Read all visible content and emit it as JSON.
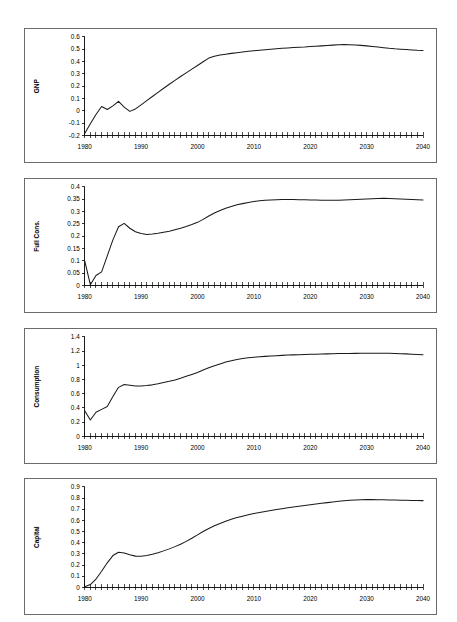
{
  "page": {
    "background": "#ffffff",
    "line_color": "#1a1a1a",
    "border_color": "#6b6b6b",
    "panel_count": 4
  },
  "chart_data": [
    {
      "type": "line",
      "title": "",
      "xlabel": "",
      "ylabel": "GNP",
      "xlim": [
        1980,
        2040
      ],
      "ylim": [
        -0.2,
        0.6
      ],
      "ytick_step": 0.1,
      "yticks": [
        -0.2,
        -0.1,
        0,
        0.1,
        0.2,
        0.3,
        0.4,
        0.5,
        0.6
      ],
      "ytick_labels": [
        "-0.2",
        "-0.1",
        "0",
        "0.1",
        "0.2",
        "0.3",
        "0.4",
        "0.5",
        "0.6"
      ],
      "xticks": [
        1980,
        1990,
        2000,
        2010,
        2020,
        2030,
        2040
      ],
      "xtick_labels": [
        "1980",
        "1990",
        "2000",
        "2010",
        "2020",
        "2030",
        "2040"
      ],
      "xtick_minor_step": 1,
      "grid": false,
      "legend": "none",
      "x": [
        1980,
        1981,
        1982,
        1983,
        1984,
        1985,
        1986,
        1987,
        1988,
        1989,
        1990,
        1991,
        1992,
        1993,
        1994,
        1995,
        1996,
        1997,
        1998,
        1999,
        2000,
        2001,
        2002,
        2003,
        2004,
        2005,
        2006,
        2007,
        2008,
        2009,
        2010,
        2011,
        2012,
        2013,
        2014,
        2015,
        2016,
        2017,
        2018,
        2019,
        2020,
        2021,
        2022,
        2023,
        2024,
        2025,
        2026,
        2027,
        2028,
        2029,
        2030,
        2031,
        2032,
        2033,
        2034,
        2035,
        2036,
        2037,
        2038,
        2039,
        2040
      ],
      "values": [
        -0.185,
        -0.105,
        -0.03,
        0.035,
        0.01,
        0.04,
        0.076,
        0.03,
        -0.005,
        0.015,
        0.048,
        0.082,
        0.116,
        0.15,
        0.183,
        0.215,
        0.247,
        0.278,
        0.308,
        0.338,
        0.368,
        0.398,
        0.428,
        0.443,
        0.452,
        0.459,
        0.466,
        0.472,
        0.478,
        0.483,
        0.488,
        0.492,
        0.496,
        0.5,
        0.504,
        0.507,
        0.51,
        0.513,
        0.516,
        0.518,
        0.521,
        0.524,
        0.527,
        0.53,
        0.533,
        0.536,
        0.537,
        0.536,
        0.534,
        0.531,
        0.527,
        0.522,
        0.517,
        0.512,
        0.507,
        0.503,
        0.5,
        0.497,
        0.494,
        0.491,
        0.489
      ]
    },
    {
      "type": "line",
      "title": "",
      "xlabel": "",
      "ylabel": "Full Cons.",
      "xlim": [
        1980,
        2040
      ],
      "ylim": [
        0,
        0.4
      ],
      "ytick_step": 0.05,
      "yticks": [
        0,
        0.05,
        0.1,
        0.15,
        0.2,
        0.25,
        0.3,
        0.35,
        0.4
      ],
      "ytick_labels": [
        "0",
        "0.05",
        "0.1",
        "0.15",
        "0.2",
        "0.25",
        "0.3",
        "0.35",
        "0.4"
      ],
      "xticks": [
        1980,
        1990,
        2000,
        2010,
        2020,
        2030,
        2040
      ],
      "xtick_labels": [
        "1980",
        "1990",
        "2000",
        "2010",
        "2020",
        "2030",
        "2040"
      ],
      "xtick_minor_step": 1,
      "grid": false,
      "legend": "none",
      "x": [
        1980,
        1981,
        1982,
        1983,
        1984,
        1985,
        1986,
        1987,
        1988,
        1989,
        1990,
        1991,
        1992,
        1993,
        1994,
        1995,
        1996,
        1997,
        1998,
        1999,
        2000,
        2001,
        2002,
        2003,
        2004,
        2005,
        2006,
        2007,
        2008,
        2009,
        2010,
        2011,
        2012,
        2013,
        2014,
        2015,
        2016,
        2017,
        2018,
        2019,
        2020,
        2021,
        2022,
        2023,
        2024,
        2025,
        2026,
        2027,
        2028,
        2029,
        2030,
        2031,
        2032,
        2033,
        2034,
        2035,
        2036,
        2037,
        2038,
        2039,
        2040
      ],
      "values": [
        0.1,
        0.003,
        0.04,
        0.055,
        0.12,
        0.185,
        0.238,
        0.252,
        0.232,
        0.218,
        0.211,
        0.207,
        0.209,
        0.212,
        0.216,
        0.22,
        0.226,
        0.232,
        0.239,
        0.247,
        0.256,
        0.268,
        0.282,
        0.294,
        0.304,
        0.313,
        0.32,
        0.327,
        0.332,
        0.337,
        0.341,
        0.344,
        0.346,
        0.347,
        0.348,
        0.349,
        0.349,
        0.349,
        0.348,
        0.348,
        0.347,
        0.347,
        0.346,
        0.346,
        0.346,
        0.346,
        0.347,
        0.348,
        0.349,
        0.35,
        0.351,
        0.352,
        0.353,
        0.354,
        0.353,
        0.352,
        0.351,
        0.35,
        0.349,
        0.348,
        0.347
      ]
    },
    {
      "type": "line",
      "title": "",
      "xlabel": "",
      "ylabel": "Consumption",
      "xlim": [
        1980,
        2040
      ],
      "ylim": [
        0,
        1.4
      ],
      "ytick_step": 0.2,
      "yticks": [
        0,
        0.2,
        0.4,
        0.6,
        0.8,
        1.0,
        1.2,
        1.4
      ],
      "ytick_labels": [
        "0",
        "0.2",
        "0.4",
        "0.6",
        "0.8",
        "1",
        "1.2",
        "1.4"
      ],
      "xticks": [
        1980,
        1990,
        2000,
        2010,
        2020,
        2030,
        2040
      ],
      "xtick_labels": [
        "1980",
        "1990",
        "2000",
        "2010",
        "2020",
        "2030",
        "2040"
      ],
      "xtick_minor_step": 1,
      "grid": false,
      "legend": "none",
      "x": [
        1980,
        1981,
        1982,
        1983,
        1984,
        1985,
        1986,
        1987,
        1988,
        1989,
        1990,
        1991,
        1992,
        1993,
        1994,
        1995,
        1996,
        1997,
        1998,
        1999,
        2000,
        2001,
        2002,
        2003,
        2004,
        2005,
        2006,
        2007,
        2008,
        2009,
        2010,
        2011,
        2012,
        2013,
        2014,
        2015,
        2016,
        2017,
        2018,
        2019,
        2020,
        2021,
        2022,
        2023,
        2024,
        2025,
        2026,
        2027,
        2028,
        2029,
        2030,
        2031,
        2032,
        2033,
        2034,
        2035,
        2036,
        2037,
        2038,
        2039,
        2040
      ],
      "values": [
        0.36,
        0.23,
        0.34,
        0.38,
        0.42,
        0.56,
        0.69,
        0.73,
        0.72,
        0.71,
        0.71,
        0.715,
        0.725,
        0.74,
        0.757,
        0.775,
        0.795,
        0.818,
        0.845,
        0.872,
        0.9,
        0.935,
        0.965,
        0.995,
        1.02,
        1.045,
        1.065,
        1.082,
        1.095,
        1.105,
        1.113,
        1.12,
        1.126,
        1.131,
        1.136,
        1.14,
        1.144,
        1.147,
        1.15,
        1.152,
        1.155,
        1.157,
        1.159,
        1.161,
        1.163,
        1.165,
        1.166,
        1.167,
        1.168,
        1.169,
        1.17,
        1.17,
        1.17,
        1.17,
        1.169,
        1.167,
        1.164,
        1.161,
        1.157,
        1.153,
        1.15
      ]
    },
    {
      "type": "line",
      "title": "",
      "xlabel": "",
      "ylabel": "Capital",
      "xlim": [
        1980,
        2040
      ],
      "ylim": [
        0,
        0.9
      ],
      "ytick_step": 0.1,
      "yticks": [
        0,
        0.1,
        0.2,
        0.3,
        0.4,
        0.5,
        0.6,
        0.7,
        0.8,
        0.9
      ],
      "ytick_labels": [
        "0",
        "0.1",
        "0.2",
        "0.3",
        "0.4",
        "0.5",
        "0.6",
        "0.7",
        "0.8",
        "0.9"
      ],
      "xticks": [
        1980,
        1990,
        2000,
        2010,
        2020,
        2030,
        2040
      ],
      "xtick_labels": [
        "1980",
        "1990",
        "2000",
        "2010",
        "2020",
        "2030",
        "2040"
      ],
      "xtick_minor_step": 1,
      "grid": false,
      "legend": "none",
      "x": [
        1980,
        1981,
        1982,
        1983,
        1984,
        1985,
        1986,
        1987,
        1988,
        1989,
        1990,
        1991,
        1992,
        1993,
        1994,
        1995,
        1996,
        1997,
        1998,
        1999,
        2000,
        2001,
        2002,
        2003,
        2004,
        2005,
        2006,
        2007,
        2008,
        2009,
        2010,
        2011,
        2012,
        2013,
        2014,
        2015,
        2016,
        2017,
        2018,
        2019,
        2020,
        2021,
        2022,
        2023,
        2024,
        2025,
        2026,
        2027,
        2028,
        2029,
        2030,
        2031,
        2032,
        2033,
        2034,
        2035,
        2036,
        2037,
        2038,
        2039,
        2040
      ],
      "values": [
        0.005,
        0.025,
        0.075,
        0.145,
        0.22,
        0.285,
        0.315,
        0.308,
        0.292,
        0.28,
        0.279,
        0.285,
        0.296,
        0.31,
        0.327,
        0.345,
        0.365,
        0.387,
        0.412,
        0.44,
        0.47,
        0.5,
        0.528,
        0.552,
        0.573,
        0.592,
        0.61,
        0.625,
        0.638,
        0.65,
        0.661,
        0.671,
        0.68,
        0.689,
        0.697,
        0.705,
        0.713,
        0.72,
        0.727,
        0.734,
        0.74,
        0.747,
        0.753,
        0.759,
        0.765,
        0.771,
        0.776,
        0.78,
        0.783,
        0.785,
        0.786,
        0.786,
        0.785,
        0.784,
        0.783,
        0.782,
        0.781,
        0.78,
        0.779,
        0.778,
        0.777
      ]
    }
  ]
}
